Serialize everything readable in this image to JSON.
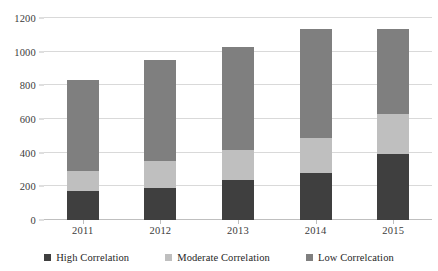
{
  "chart_data": {
    "type": "bar",
    "subtype": "stacked-column",
    "title": "",
    "subtitle": "",
    "xlabel": "",
    "ylabel": "",
    "categories": [
      "2011",
      "2012",
      "2013",
      "2014",
      "2015"
    ],
    "series": [
      {
        "name": "High Correlation",
        "color": "#3f3f3f",
        "values": [
          170,
          190,
          240,
          280,
          390
        ]
      },
      {
        "name": "Moderate Correlation",
        "color": "#bfbfbf",
        "values": [
          120,
          160,
          175,
          205,
          240
        ]
      },
      {
        "name": "Low Correlcation",
        "color": "#7f7f7f",
        "values": [
          540,
          600,
          610,
          650,
          505
        ]
      }
    ],
    "totals": [
      830,
      950,
      1025,
      1135,
      1135
    ],
    "ylim": [
      0,
      1200
    ],
    "ytick_step": 200,
    "yticks": [
      "0",
      "200",
      "400",
      "600",
      "800",
      "1000",
      "1200"
    ],
    "grid": true,
    "grid_axis": "y",
    "legend_position": "bottom",
    "legend": [
      "High Correlation",
      "Moderate Correlation",
      "Low Correlcation"
    ],
    "gridline_color": "#d9d9d9",
    "axis_color": "#bfbfbf",
    "text_color": "#3b3b3b",
    "background": "#ffffff"
  }
}
